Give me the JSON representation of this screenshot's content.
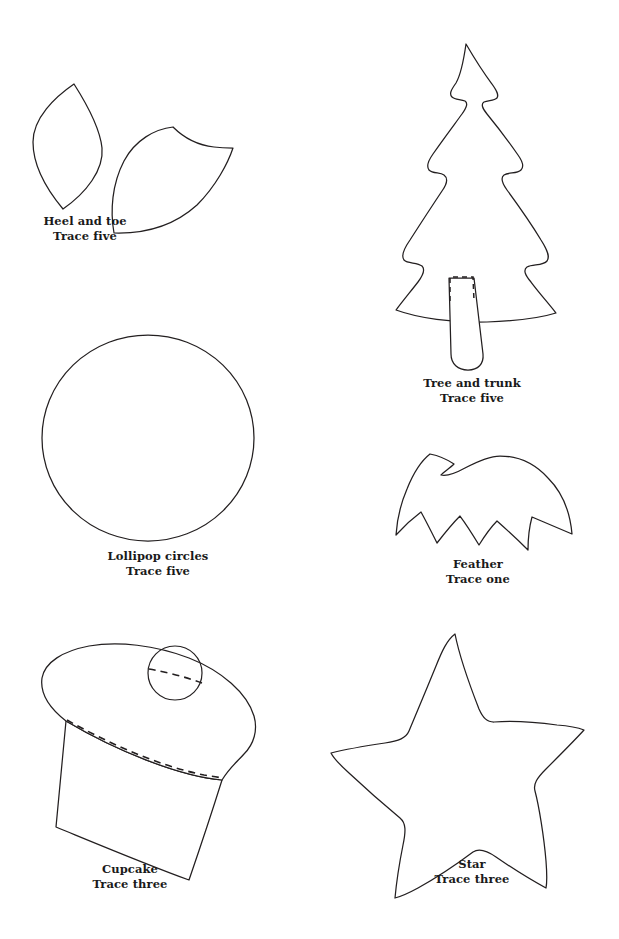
{
  "page": {
    "type": "craft-pattern-template-sheet",
    "background_color": "#ffffff",
    "line_color": "#231f20",
    "width": 619,
    "height": 939
  },
  "patterns": [
    {
      "id": "heel-and-toe",
      "name_line": "Heel and toe",
      "trace_line": "Trace five",
      "trace_count": "five",
      "shape_kind": "two-leaf-pieces",
      "has_dashed_fold": false
    },
    {
      "id": "tree-and-trunk",
      "name_line": "Tree and trunk",
      "trace_line": "Trace five",
      "trace_count": "five",
      "shape_kind": "christmas-tree-with-stick",
      "has_dashed_fold": true
    },
    {
      "id": "lollipop-circles",
      "name_line": "Lollipop circles",
      "trace_line": "Trace five",
      "trace_count": "five",
      "shape_kind": "circle",
      "has_dashed_fold": false
    },
    {
      "id": "feather",
      "name_line": "Feather",
      "trace_line": "Trace one",
      "trace_count": "one",
      "shape_kind": "feather-arc-with-notches",
      "has_dashed_fold": false
    },
    {
      "id": "cupcake",
      "name_line": "Cupcake",
      "trace_line": "Trace three",
      "trace_count": "three",
      "shape_kind": "cupcake-with-cherry",
      "has_dashed_fold": true
    },
    {
      "id": "star",
      "name_line": "Star",
      "trace_line": "Trace three",
      "trace_count": "three",
      "shape_kind": "five-point-star",
      "has_dashed_fold": false
    }
  ],
  "captions": {
    "heel_and_toe": {
      "name": "Heel and toe",
      "trace": "Trace five"
    },
    "tree_and_trunk": {
      "name": "Tree and trunk",
      "trace": "Trace five"
    },
    "lollipop_circles": {
      "name": "Lollipop circles",
      "trace": "Trace five"
    },
    "feather": {
      "name": "Feather",
      "trace": "Trace one"
    },
    "cupcake": {
      "name": "Cupcake",
      "trace": "Trace three"
    },
    "star": {
      "name": "Star",
      "trace": "Trace three"
    }
  }
}
